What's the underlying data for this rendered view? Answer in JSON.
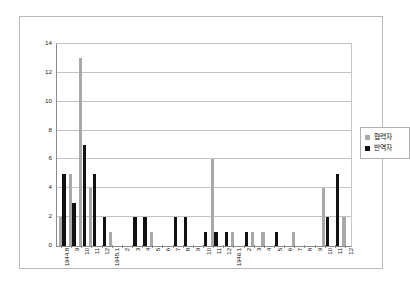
{
  "chart_data": {
    "type": "bar",
    "title": "",
    "xlabel": "",
    "ylabel": "",
    "ylim": [
      0,
      14
    ],
    "yticks": [
      0,
      2,
      4,
      6,
      8,
      10,
      12,
      14
    ],
    "grid": true,
    "legend_position": "right",
    "categories": [
      "1944.8",
      "9",
      "10",
      "11",
      "12",
      "1945.1",
      "2",
      "3",
      "4",
      "5",
      "6",
      "7",
      "8",
      "9",
      "10",
      "11",
      "12",
      "1946.1",
      "2",
      "3",
      "4",
      "5",
      "6",
      "7",
      "8",
      "9",
      "10",
      "11",
      "12"
    ],
    "series": [
      {
        "name": "협력자",
        "color": "#a9a9a9",
        "values": [
          2,
          5,
          13,
          4,
          0,
          1,
          0,
          0,
          0,
          1,
          0,
          0,
          0,
          0,
          0,
          6,
          0,
          1,
          0,
          1,
          1,
          0,
          0,
          1,
          0,
          0,
          4,
          0,
          2
        ]
      },
      {
        "name": "반역자",
        "color": "#121212",
        "values": [
          5,
          3,
          7,
          5,
          2,
          0,
          0,
          2,
          2,
          0,
          0,
          2,
          2,
          0,
          1,
          1,
          1,
          0,
          1,
          0,
          0,
          1,
          0,
          0,
          0,
          0,
          2,
          5,
          0
        ]
      }
    ]
  },
  "legend": {
    "items": [
      {
        "label": "협력자",
        "swatch": "collab"
      },
      {
        "label": "반역자",
        "swatch": "traitor"
      }
    ]
  }
}
